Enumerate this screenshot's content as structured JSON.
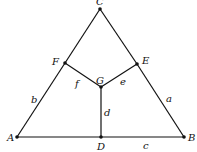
{
  "diagram": {
    "type": "graph",
    "vertices": [
      {
        "id": "A",
        "label": "A",
        "x": 17,
        "y": 137,
        "lx": 7,
        "ly": 141
      },
      {
        "id": "B",
        "label": "B",
        "x": 184,
        "y": 137,
        "lx": 188,
        "ly": 141
      },
      {
        "id": "C",
        "label": "C",
        "x": 100,
        "y": 9,
        "lx": 96,
        "ly": 5
      },
      {
        "id": "D",
        "label": "D",
        "x": 101,
        "y": 137,
        "lx": 97,
        "ly": 150
      },
      {
        "id": "E",
        "label": "E",
        "x": 137,
        "y": 64,
        "lx": 142,
        "ly": 64
      },
      {
        "id": "F",
        "label": "F",
        "x": 65,
        "y": 63,
        "lx": 52,
        "ly": 65
      },
      {
        "id": "G",
        "label": "G",
        "x": 101,
        "y": 87,
        "lx": 96,
        "ly": 84
      }
    ],
    "edges": [
      {
        "from": "A",
        "to": "D",
        "label": ""
      },
      {
        "from": "D",
        "to": "B",
        "label": "c",
        "lx": 143,
        "ly": 149
      },
      {
        "from": "B",
        "to": "E",
        "label": "a",
        "lx": 166,
        "ly": 102
      },
      {
        "from": "E",
        "to": "C",
        "label": ""
      },
      {
        "from": "C",
        "to": "F",
        "label": ""
      },
      {
        "from": "F",
        "to": "A",
        "label": "b",
        "lx": 31,
        "ly": 103
      },
      {
        "from": "F",
        "to": "G",
        "label": "f",
        "lx": 75,
        "ly": 87
      },
      {
        "from": "G",
        "to": "E",
        "label": "e",
        "lx": 120,
        "ly": 85
      },
      {
        "from": "G",
        "to": "D",
        "label": "d",
        "lx": 104,
        "ly": 116
      }
    ]
  }
}
